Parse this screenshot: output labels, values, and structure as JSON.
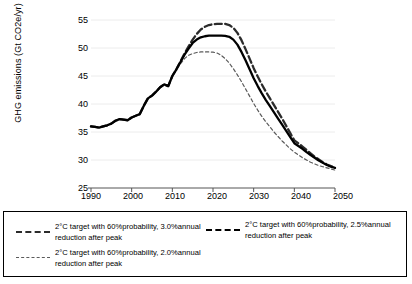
{
  "chart": {
    "ylabel": "GHG emissions (Gt CO2e/yr)",
    "xlabel": "",
    "yticks": [
      "55",
      "50",
      "45",
      "40",
      "35",
      "30",
      "25"
    ],
    "xticks": [
      "1990",
      "2000",
      "2010",
      "2020",
      "2030",
      "2040",
      "2050"
    ]
  },
  "legend": {
    "entry1": "2°C target with 60%probability, 3.0%annual\nreduction after peak",
    "entry2": "2°C target with 60%probability, 2.5%annual\nreduction after peak",
    "entry3": "2°C target with 60%probability, 2.0%annual\nreduction after peak"
  },
  "chart_data": {
    "type": "line",
    "title": "",
    "xlabel": "",
    "ylabel": "GHG emissions (Gt CO2e/yr)",
    "xlim": [
      1990,
      2050
    ],
    "ylim": [
      25,
      55
    ],
    "ytick_values": [
      25,
      30,
      35,
      40,
      45,
      50,
      55
    ],
    "xtick_values": [
      1990,
      2000,
      2010,
      2020,
      2030,
      2040,
      2050
    ],
    "grid": "faint-horizontal",
    "legend_position": "below-plot-boxed",
    "x": [
      1990,
      1991,
      1992,
      1993,
      1994,
      1995,
      1996,
      1997,
      1998,
      1999,
      2000,
      2001,
      2002,
      2003,
      2004,
      2005,
      2006,
      2007,
      2008,
      2009,
      2010,
      2011,
      2012,
      2013,
      2014,
      2015,
      2016,
      2017,
      2018,
      2019,
      2020,
      2021,
      2022,
      2023,
      2024,
      2025,
      2026,
      2027,
      2028,
      2029,
      2030,
      2031,
      2032,
      2033,
      2034,
      2035,
      2036,
      2037,
      2038,
      2039,
      2040,
      2041,
      2042,
      2043,
      2044,
      2045,
      2046,
      2047,
      2048,
      2049,
      2050
    ],
    "series": [
      {
        "name": "2°C target with 60%probability, 3.0%annual reduction after peak",
        "style": "dashed-thick",
        "color": "#2b2b2b",
        "peak_year": 2023,
        "peak_value": 54.3,
        "annual_reduction_after_peak_pct": 3.0,
        "values": [
          36.0,
          35.9,
          35.8,
          36.0,
          36.2,
          36.5,
          37.0,
          37.3,
          37.2,
          37.1,
          37.6,
          37.9,
          38.2,
          39.7,
          41.0,
          41.5,
          42.2,
          43.0,
          43.5,
          43.2,
          45.0,
          46.2,
          47.6,
          49.0,
          50.3,
          51.5,
          52.5,
          53.3,
          53.8,
          54.1,
          54.25,
          54.3,
          54.3,
          54.3,
          54.1,
          53.6,
          52.7,
          51.4,
          49.8,
          48.1,
          46.4,
          44.9,
          43.5,
          42.2,
          41.0,
          39.8,
          38.6,
          37.4,
          36.1,
          34.8,
          33.5,
          33.0,
          32.4,
          31.8,
          31.2,
          30.6,
          30.1,
          29.6,
          29.2,
          28.9,
          28.7
        ]
      },
      {
        "name": "2°C target with 60%probability, 2.5%annual reduction after peak",
        "style": "solid",
        "color": "#000000",
        "peak_year": 2021,
        "peak_value": 52.2,
        "annual_reduction_after_peak_pct": 2.5,
        "values": [
          36.0,
          35.9,
          35.8,
          36.0,
          36.2,
          36.5,
          37.0,
          37.3,
          37.2,
          37.1,
          37.6,
          37.9,
          38.2,
          39.7,
          41.0,
          41.5,
          42.2,
          43.0,
          43.5,
          43.2,
          45.0,
          46.2,
          47.5,
          48.8,
          49.9,
          50.9,
          51.5,
          51.9,
          52.1,
          52.2,
          52.2,
          52.2,
          52.2,
          52.15,
          52.0,
          51.5,
          50.6,
          49.3,
          47.8,
          46.2,
          44.6,
          43.2,
          41.9,
          40.7,
          39.6,
          38.5,
          37.4,
          36.3,
          35.2,
          34.1,
          33.0,
          32.5,
          32.0,
          31.4,
          30.9,
          30.4,
          29.9,
          29.5,
          29.1,
          28.8,
          28.6
        ]
      },
      {
        "name": "2°C target with 60%probability, 2.0%annual reduction after peak",
        "style": "dashed-thin",
        "color": "#5a5a5a",
        "peak_year": 2019,
        "peak_value": 49.3,
        "annual_reduction_after_peak_pct": 2.0,
        "values": [
          36.0,
          35.9,
          35.8,
          36.0,
          36.2,
          36.5,
          37.0,
          37.3,
          37.2,
          37.1,
          37.6,
          37.9,
          38.2,
          39.7,
          41.0,
          41.5,
          42.2,
          43.0,
          43.5,
          43.2,
          45.0,
          46.1,
          47.2,
          48.1,
          48.7,
          49.0,
          49.2,
          49.3,
          49.3,
          49.3,
          49.25,
          49.1,
          48.7,
          48.1,
          47.3,
          46.3,
          45.2,
          44.0,
          42.7,
          41.4,
          40.1,
          38.9,
          37.8,
          36.8,
          35.9,
          35.0,
          34.2,
          33.4,
          32.7,
          32.0,
          31.4,
          30.9,
          30.4,
          30.0,
          29.6,
          29.3,
          29.0,
          28.8,
          28.6,
          28.4,
          28.2
        ]
      }
    ]
  }
}
